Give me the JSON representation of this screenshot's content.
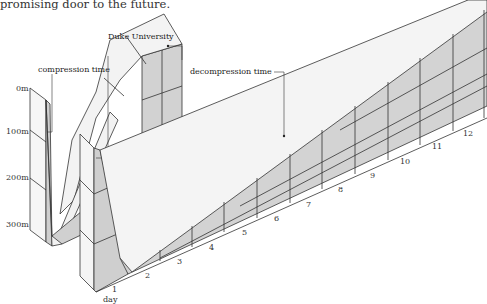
{
  "caption": "promising door to the future.",
  "labels": {
    "duke": "Duke University",
    "compression": "compression time",
    "decompression": "decompression time",
    "day_axis": "day"
  },
  "depth_axis": [
    "0m",
    "100m",
    "200m",
    "300m"
  ],
  "day_ticks": [
    "1",
    "2",
    "3",
    "4",
    "5",
    "6",
    "7",
    "8",
    "9",
    "10",
    "11",
    "12"
  ],
  "colors": {
    "wall": "#d4d4d4",
    "ribbon": "#f4f4f4",
    "pillar": "#f7f7f7",
    "line": "#333333"
  }
}
